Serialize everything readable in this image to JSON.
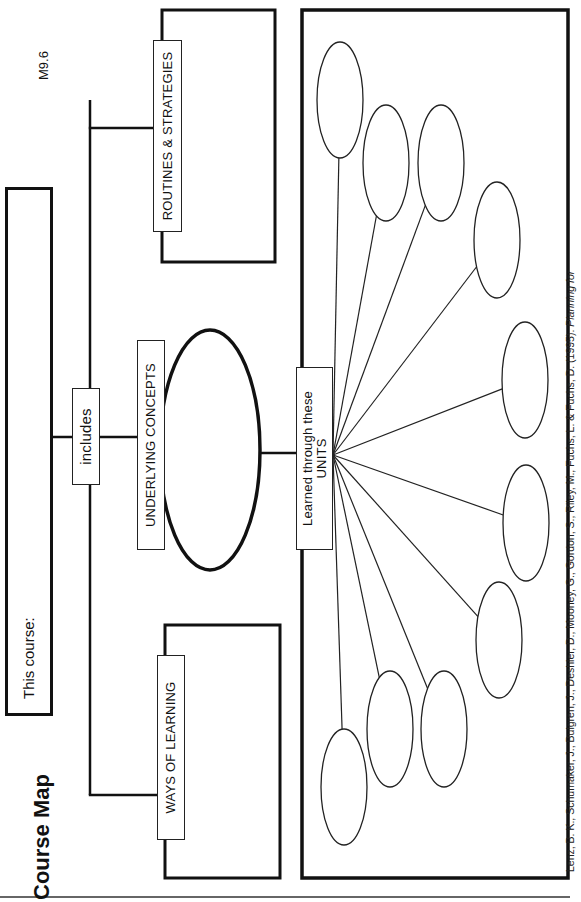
{
  "document": {
    "title": "Course Map",
    "code": "M9.6",
    "course_prompt": "This course:",
    "includes_label": "includes",
    "routines_label": "ROUTINES & STRATEGIES",
    "concepts_label": "UNDERLYING CONCEPTS",
    "ways_label": "WAYS OF LEARNING",
    "units_label_line1": "Learned through these",
    "units_label_line2": "UNITS",
    "citation": "Lenz, B. K., Schumaker, J., Bulgren, J., Deshler, D., Mooney, G., Gordon, S., Riley, M., Fuchs, L. & Fuchs, D. (1995).",
    "citation_italic": "Planning for"
  },
  "unit_slots": {
    "count": 10,
    "values": [
      "",
      "",
      "",
      "",
      "",
      "",
      "",
      "",
      "",
      ""
    ]
  }
}
